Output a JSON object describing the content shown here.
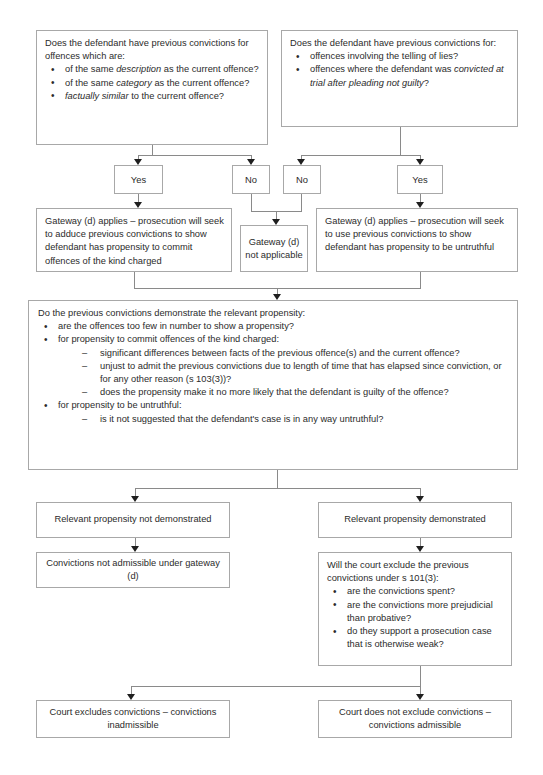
{
  "page": {
    "top_faint_text": "",
    "accent_border": "#a8a8a8",
    "text_color": "#2b2b2b",
    "arrow_color": "#1f1f1f",
    "background": "#ffffff"
  },
  "nodes": {
    "q1": {
      "lead": "Does the defendant have previous convictions for offences which are:",
      "bullets": [
        {
          "pre": "of the same ",
          "em": "description",
          "post": " as the current offence?"
        },
        {
          "pre": "of the same ",
          "em": "category",
          "post": " as the current offence?"
        },
        {
          "pre": "",
          "em": "factually similar",
          "post": " to the current offence?"
        }
      ]
    },
    "q2": {
      "lead": "Does the defendant have previous convictions for:",
      "bullets": [
        {
          "pre": "offences involving the telling of lies?",
          "em": "",
          "post": ""
        },
        {
          "pre": "offences where the defendant was ",
          "em": "convicted at trial after pleading not guilty",
          "post": "?"
        }
      ]
    },
    "yes_left": "Yes",
    "no_left": "No",
    "no_right": "No",
    "yes_right": "Yes",
    "gateway_left": "Gateway (d) applies – prosecution will seek to adduce previous convictions to show defendant has propensity to commit offences of the kind charged",
    "gateway_na": "Gateway (d) not applicable",
    "gateway_right": "Gateway (d) applies – prosecution will seek to use previous convictions to show defendant has propensity to be untruthful",
    "propensity": {
      "lead": "Do the previous convictions demonstrate the relevant propensity:",
      "b1": "are the offences too few in number to show a propensity?",
      "b2": "for propensity to commit offences of the kind charged:",
      "b2_subs": [
        "significant differences between facts of the previous offence(s) and the current offence?",
        "unjust to admit the previous convictions due to length of time that has elapsed since conviction, or for any other reason (s 103(3))?",
        "does the propensity make it no more likely that the defendant is guilty of the offence?"
      ],
      "b3": "for propensity to be untruthful:",
      "b3_subs": [
        "is it not suggested that the defendant's case is in any way untruthful?"
      ]
    },
    "prop_not_demo": "Relevant propensity not demonstrated",
    "prop_demo": "Relevant propensity demonstrated",
    "not_admissible": "Convictions not admissible under gateway (d)",
    "s101": {
      "lead": "Will the court exclude the previous convictions under s 101(3):",
      "bullets": [
        "are the convictions spent?",
        "are the convictions more prejudicial than probative?",
        "do they support a prosecution case that is otherwise weak?"
      ]
    },
    "excludes": "Court excludes convictions – convictions inadmissible",
    "not_excludes": "Court does not exclude convictions – convictions admissible"
  }
}
